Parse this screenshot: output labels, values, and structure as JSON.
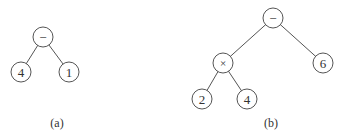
{
  "diagram": {
    "trees": [
      {
        "caption": "(a)",
        "caption_pos": [
          57,
          123
        ],
        "nodes": [
          {
            "id": "a-root",
            "label": "−",
            "x": 43,
            "y": 37
          },
          {
            "id": "a-left",
            "label": "4",
            "x": 21,
            "y": 72
          },
          {
            "id": "a-right",
            "label": "1",
            "x": 69,
            "y": 72
          }
        ],
        "edges": [
          [
            "a-root",
            "a-left"
          ],
          [
            "a-root",
            "a-right"
          ]
        ]
      },
      {
        "caption": "(b)",
        "caption_pos": [
          271,
          123
        ],
        "nodes": [
          {
            "id": "b-root",
            "label": "−",
            "x": 273,
            "y": 18
          },
          {
            "id": "b-mul",
            "label": "×",
            "x": 223,
            "y": 63
          },
          {
            "id": "b-six",
            "label": "6",
            "x": 323,
            "y": 63
          },
          {
            "id": "b-two",
            "label": "2",
            "x": 202,
            "y": 99
          },
          {
            "id": "b-four",
            "label": "4",
            "x": 247,
            "y": 99
          }
        ],
        "edges": [
          [
            "b-root",
            "b-mul"
          ],
          [
            "b-root",
            "b-six"
          ],
          [
            "b-mul",
            "b-two"
          ],
          [
            "b-mul",
            "b-four"
          ]
        ]
      }
    ],
    "node_radius": 10
  }
}
